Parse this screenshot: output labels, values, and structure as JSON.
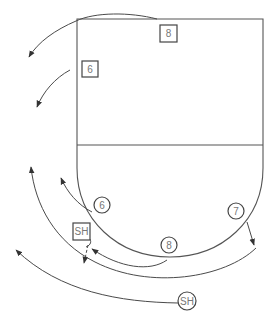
{
  "diagram": {
    "colors": {
      "line": "#4a4a4a",
      "background": "#ffffff",
      "text": "#777777"
    },
    "players": [
      {
        "id": "box-8",
        "shape": "square",
        "label": "8",
        "x": 168,
        "y": 33
      },
      {
        "id": "box-6",
        "shape": "square",
        "label": "6",
        "x": 90,
        "y": 69
      },
      {
        "id": "box-sh",
        "shape": "square",
        "label": "SH",
        "x": 81,
        "y": 231
      },
      {
        "id": "circle-6",
        "shape": "circle",
        "label": "6",
        "x": 102,
        "y": 205
      },
      {
        "id": "circle-7",
        "shape": "circle",
        "label": "7",
        "x": 236,
        "y": 211
      },
      {
        "id": "circle-8",
        "shape": "circle",
        "label": "8",
        "x": 169,
        "y": 245
      },
      {
        "id": "circle-sh",
        "shape": "circle",
        "label": "SH",
        "x": 187,
        "y": 301
      }
    ]
  }
}
